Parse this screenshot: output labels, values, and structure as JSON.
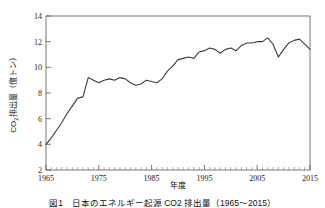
{
  "figure": {
    "caption": "図1　日本のエネルギー起源 CO2 排出量（1965～2015）"
  },
  "chart_data": {
    "type": "line",
    "title": "",
    "xlabel": "年度",
    "ylabel": "CO2排出量（億トン）",
    "ylabel_main": "CO",
    "ylabel_sub": "2",
    "ylabel_rest": "排出量（億トン）",
    "xlim": [
      1965,
      2015
    ],
    "ylim": [
      2,
      14
    ],
    "grid": false,
    "legend": null,
    "x_ticks": [
      1965,
      1975,
      1985,
      1995,
      2005,
      2015
    ],
    "x_minor_tick_step": 1,
    "y_ticks": [
      2,
      4,
      6,
      8,
      10,
      12,
      14
    ],
    "series": [
      {
        "name": "CO2排出量",
        "color": "#3b3b3b",
        "x": [
          1965,
          1966,
          1967,
          1968,
          1969,
          1970,
          1971,
          1972,
          1973,
          1974,
          1975,
          1976,
          1977,
          1978,
          1979,
          1980,
          1981,
          1982,
          1983,
          1984,
          1985,
          1986,
          1987,
          1988,
          1989,
          1990,
          1991,
          1992,
          1993,
          1994,
          1995,
          1996,
          1997,
          1998,
          1999,
          2000,
          2001,
          2002,
          2003,
          2004,
          2005,
          2006,
          2007,
          2008,
          2009,
          2010,
          2011,
          2012,
          2013,
          2014,
          2015
        ],
        "values": [
          4.0,
          4.5,
          5.1,
          5.7,
          6.4,
          7.0,
          7.6,
          7.7,
          9.2,
          9.0,
          8.8,
          9.0,
          9.1,
          9.0,
          9.2,
          9.1,
          8.8,
          8.6,
          8.7,
          9.0,
          8.9,
          8.8,
          9.1,
          9.7,
          10.1,
          10.6,
          10.7,
          10.8,
          10.7,
          11.2,
          11.3,
          11.5,
          11.4,
          11.1,
          11.4,
          11.5,
          11.3,
          11.7,
          11.9,
          11.9,
          12.0,
          12.0,
          12.3,
          11.8,
          10.8,
          11.4,
          11.9,
          12.1,
          12.2,
          11.8,
          11.4
        ]
      }
    ]
  }
}
